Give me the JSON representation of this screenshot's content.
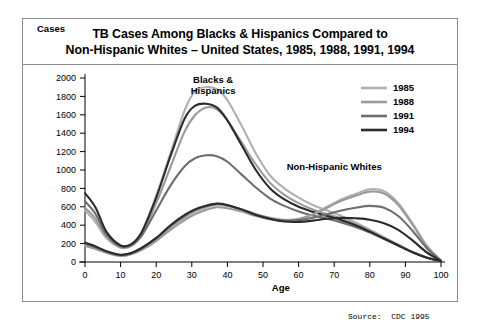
{
  "title": {
    "line1": "TB Cases Among Blacks & Hispanics Compared to",
    "line2": "Non-Hispanic Whites – United States, 1985, 1988, 1991, 1994"
  },
  "source": "Source:  CDC 1995",
  "chart_data": {
    "type": "line",
    "title": "TB Cases Among Blacks & Hispanics Compared to Non-Hispanic Whites – United States, 1985, 1988, 1991, 1994",
    "xlabel": "Age",
    "ylabel": "Cases",
    "xlim": [
      0,
      100
    ],
    "ylim": [
      0,
      2000
    ],
    "xticks": [
      0,
      10,
      20,
      30,
      40,
      50,
      60,
      70,
      80,
      90,
      100
    ],
    "yticks": [
      0,
      200,
      400,
      600,
      800,
      1000,
      1200,
      1400,
      1600,
      1800,
      2000
    ],
    "grid": false,
    "legend_position": "top-right",
    "annotations": [
      {
        "text": "Blacks & Hispanics",
        "x": 36,
        "y": 1950,
        "lines": [
          "Blacks &",
          "Hispanics"
        ]
      },
      {
        "text": "Non-Hispanic Whites",
        "x": 70,
        "y": 1000
      }
    ],
    "legend": [
      {
        "label": "1985",
        "color": "#b0b0b0"
      },
      {
        "label": "1988",
        "color": "#9a9a9a"
      },
      {
        "label": "1991",
        "color": "#6e6e6e"
      },
      {
        "label": "1994",
        "color": "#2b2b2b"
      }
    ],
    "x": [
      0,
      3,
      6,
      10,
      13,
      16,
      20,
      24,
      28,
      31,
      34,
      37,
      40,
      44,
      48,
      52,
      56,
      60,
      64,
      68,
      72,
      76,
      80,
      84,
      88,
      92,
      96,
      100
    ],
    "series": [
      {
        "name": "1985",
        "group": "Blacks & Hispanics",
        "color": "#b0b0b0",
        "values": [
          560,
          430,
          260,
          155,
          180,
          330,
          720,
          1180,
          1650,
          1860,
          1900,
          1880,
          1760,
          1480,
          1180,
          940,
          800,
          700,
          620,
          560,
          500,
          430,
          350,
          270,
          190,
          110,
          50,
          10
        ]
      },
      {
        "name": "1988",
        "group": "Blacks & Hispanics",
        "color": "#9a9a9a",
        "values": [
          590,
          470,
          280,
          160,
          175,
          300,
          640,
          1030,
          1420,
          1600,
          1680,
          1660,
          1540,
          1300,
          1060,
          860,
          730,
          640,
          570,
          520,
          470,
          410,
          340,
          260,
          185,
          108,
          48,
          10
        ]
      },
      {
        "name": "1991",
        "group": "Blacks & Hispanics",
        "color": "#6e6e6e",
        "values": [
          660,
          520,
          300,
          170,
          185,
          290,
          560,
          830,
          1040,
          1130,
          1160,
          1150,
          1090,
          950,
          810,
          690,
          610,
          550,
          505,
          470,
          430,
          380,
          320,
          250,
          178,
          105,
          46,
          10
        ]
      },
      {
        "name": "1994",
        "group": "Blacks & Hispanics",
        "color": "#2b2b2b",
        "values": [
          750,
          590,
          330,
          180,
          195,
          330,
          700,
          1150,
          1560,
          1700,
          1720,
          1680,
          1540,
          1270,
          1000,
          800,
          680,
          600,
          545,
          500,
          455,
          400,
          330,
          255,
          180,
          106,
          47,
          10
        ]
      },
      {
        "name": "1985",
        "group": "Non-Hispanic Whites",
        "color": "#b0b0b0",
        "values": [
          185,
          150,
          105,
          70,
          90,
          140,
          240,
          370,
          480,
          545,
          590,
          620,
          610,
          570,
          520,
          480,
          460,
          470,
          520,
          600,
          680,
          740,
          790,
          770,
          640,
          420,
          180,
          15
        ]
      },
      {
        "name": "1988",
        "group": "Non-Hispanic Whites",
        "color": "#9a9a9a",
        "values": [
          175,
          142,
          100,
          66,
          85,
          132,
          228,
          350,
          455,
          520,
          565,
          595,
          585,
          548,
          500,
          465,
          450,
          465,
          515,
          590,
          665,
          720,
          765,
          745,
          620,
          405,
          172,
          14
        ]
      },
      {
        "name": "1991",
        "group": "Non-Hispanic Whites",
        "color": "#6e6e6e",
        "values": [
          200,
          160,
          112,
          75,
          95,
          150,
          255,
          390,
          500,
          565,
          605,
          630,
          615,
          570,
          515,
          475,
          450,
          455,
          480,
          520,
          560,
          590,
          610,
          590,
          500,
          340,
          150,
          13
        ]
      },
      {
        "name": "1994",
        "group": "Non-Hispanic Whites",
        "color": "#2b2b2b",
        "values": [
          210,
          168,
          118,
          78,
          98,
          155,
          262,
          400,
          512,
          575,
          612,
          635,
          620,
          572,
          512,
          468,
          440,
          436,
          450,
          470,
          480,
          475,
          460,
          420,
          350,
          235,
          105,
          12
        ]
      }
    ]
  }
}
